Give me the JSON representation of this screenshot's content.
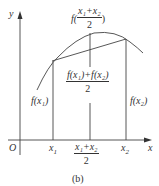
{
  "diagram": {
    "axis_y_label": "y",
    "axis_x_label": "x",
    "origin_label": "O",
    "x1_label": "x",
    "x1_sub": "1",
    "x2_label": "x",
    "x2_sub": "2",
    "mid_numerator": "x₁+x₂",
    "mid_denominator": "2",
    "f_mid_prefix": "f(",
    "f_mid_numerator": "x₁+x₂",
    "f_mid_denominator": "2",
    "f_mid_suffix": ")",
    "avg_numerator": "f(x₁)+f(x₂)",
    "avg_denominator": "2",
    "fx1_label": "f(x₁)",
    "fx2_label": "f(x₂)",
    "caption": "(b)"
  },
  "colors": {
    "line": "#444444",
    "text": "#333333"
  }
}
